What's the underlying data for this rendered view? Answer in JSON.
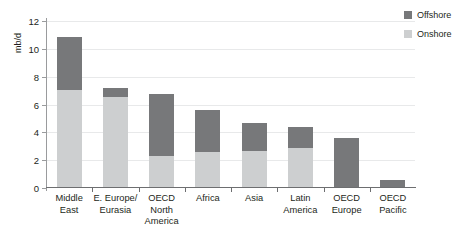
{
  "chart_data": {
    "type": "bar",
    "subtype": "stacked-bar",
    "title": "",
    "xlabel": "",
    "ylabel": "mb/d",
    "ylim": [
      0,
      12
    ],
    "yticks": [
      0,
      2,
      4,
      6,
      8,
      10,
      12
    ],
    "ytick_labels": [
      "0",
      "2",
      "4",
      "6",
      "8",
      "10",
      "12"
    ],
    "grid": true,
    "grid_axis": "y",
    "legend_position": "top-right",
    "categories": [
      "Middle East",
      "E. Europe/ Eurasia",
      "OECD North America",
      "Africa",
      "Asia",
      "Latin America",
      "OECD Europe",
      "OECD Pacific"
    ],
    "category_lines": [
      [
        "Middle",
        "East"
      ],
      [
        "E. Europe/",
        "Eurasia"
      ],
      [
        "OECD North",
        "America"
      ],
      [
        "Africa",
        ""
      ],
      [
        "Asia",
        ""
      ],
      [
        "Latin",
        "America"
      ],
      [
        "OECD",
        "Europe"
      ],
      [
        "OECD",
        "Pacific"
      ]
    ],
    "series": [
      {
        "name": "Onshore",
        "color": "#cdcfd0",
        "values": [
          7.0,
          6.5,
          2.2,
          2.5,
          2.6,
          2.8,
          0.0,
          0.0
        ]
      },
      {
        "name": "Offshore",
        "color": "#77787a",
        "values": [
          3.8,
          0.6,
          4.5,
          3.0,
          2.0,
          1.5,
          3.5,
          0.5
        ]
      }
    ],
    "totals": [
      10.8,
      7.1,
      6.7,
      5.5,
      4.6,
      4.3,
      3.5,
      0.5
    ]
  },
  "legend": {
    "items": [
      {
        "label": "Offshore",
        "color": "#77787a"
      },
      {
        "label": "Onshore",
        "color": "#cdcfd0"
      }
    ]
  }
}
